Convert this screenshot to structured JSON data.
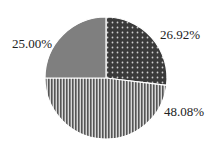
{
  "chart_data": {
    "type": "pie",
    "title": "",
    "start_angle_deg": 90,
    "direction": "clockwise",
    "slices": [
      {
        "label": "26.92%",
        "value": 26.92,
        "fill": "#3a3a3a",
        "pattern": "dots"
      },
      {
        "label": "48.08%",
        "value": 48.08,
        "fill": "#8a8a8a",
        "pattern": "vertical-stripes"
      },
      {
        "label": "25.00%",
        "value": 25.0,
        "fill": "#7f7f7f",
        "pattern": "solid"
      }
    ],
    "legend": null
  },
  "labels": {
    "slice_0": "26.92%",
    "slice_1": "48.08%",
    "slice_2": "25.00%"
  }
}
